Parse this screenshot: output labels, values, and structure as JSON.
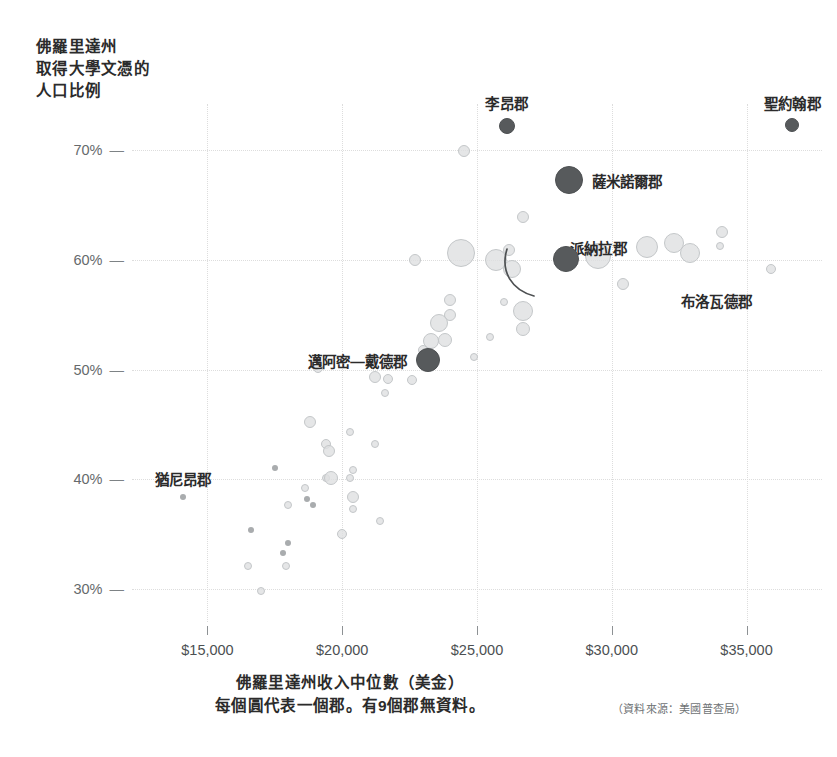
{
  "chart_data": {
    "type": "scatter",
    "title": "",
    "ylabel": "佛羅里達州取得大學文憑的人口比例",
    "xlabel": "佛羅里達州收入中位數（美金）",
    "xlim": [
      12200,
      37800
    ],
    "ylim": [
      27.0,
      73.5
    ],
    "grid": true,
    "legend": "none",
    "note": "每個圓代表一個郡。有9個郡無資料。",
    "source": "（資料來源：美國普查局）",
    "size_encoding": "圓面積代表郡人口",
    "y_ticks": [
      {
        "value": 70,
        "label": "70%"
      },
      {
        "value": 60,
        "label": "60%"
      },
      {
        "value": 50,
        "label": "50%"
      },
      {
        "value": 40,
        "label": "40%"
      },
      {
        "value": 30,
        "label": "30%"
      }
    ],
    "x_ticks": [
      {
        "value": 15000,
        "label": "$15,000"
      },
      {
        "value": 20000,
        "label": "$20,000"
      },
      {
        "value": 25000,
        "label": "$25,000"
      },
      {
        "value": 30000,
        "label": "$30,000"
      },
      {
        "value": 35000,
        "label": "$35,000"
      }
    ],
    "highlight_color": "#575a5c",
    "bubble_color": "#dee0e1",
    "labeled_points": [
      {
        "name": "李昂郡",
        "x": 26100,
        "y": 72.2,
        "r": 8,
        "style": "dark",
        "label_pos": "above-center"
      },
      {
        "name": "聖約翰郡",
        "x": 36700,
        "y": 72.3,
        "r": 7,
        "style": "dark",
        "label_pos": "above-center"
      },
      {
        "name": "薩米諾爾郡",
        "x": 28400,
        "y": 67.3,
        "r": 14,
        "style": "dark",
        "label_pos": "right"
      },
      {
        "name": "派納拉郡",
        "x": 31300,
        "y": 61.2,
        "r": 11,
        "style": "light",
        "label_pos": "left"
      },
      {
        "name": "布洛瓦德郡",
        "x": 28300,
        "y": 60.1,
        "r": 13,
        "style": "dark",
        "label_pos": "leader"
      },
      {
        "name": "邁阿密—戴德郡",
        "x": 23200,
        "y": 50.9,
        "r": 12,
        "style": "dark",
        "label_pos": "left"
      },
      {
        "name": "猶尼昂郡",
        "x": 14100,
        "y": 38.4,
        "r": 3,
        "style": "tiny",
        "label_pos": "above-center"
      }
    ],
    "points": [
      {
        "x": 24500,
        "y": 69.9,
        "r": 6
      },
      {
        "x": 26700,
        "y": 63.9,
        "r": 6
      },
      {
        "x": 22700,
        "y": 60.0,
        "r": 6
      },
      {
        "x": 24400,
        "y": 60.6,
        "r": 14
      },
      {
        "x": 25700,
        "y": 60.0,
        "r": 11
      },
      {
        "x": 26200,
        "y": 60.9,
        "r": 6
      },
      {
        "x": 26300,
        "y": 59.2,
        "r": 9
      },
      {
        "x": 29500,
        "y": 60.4,
        "r": 13
      },
      {
        "x": 32300,
        "y": 61.6,
        "r": 10
      },
      {
        "x": 32900,
        "y": 60.6,
        "r": 10
      },
      {
        "x": 34100,
        "y": 62.6,
        "r": 6
      },
      {
        "x": 34000,
        "y": 61.3,
        "r": 4
      },
      {
        "x": 30400,
        "y": 57.8,
        "r": 6
      },
      {
        "x": 35900,
        "y": 59.2,
        "r": 5
      },
      {
        "x": 24000,
        "y": 56.4,
        "r": 6
      },
      {
        "x": 24000,
        "y": 55.0,
        "r": 6
      },
      {
        "x": 23600,
        "y": 54.3,
        "r": 9
      },
      {
        "x": 26700,
        "y": 55.4,
        "r": 10
      },
      {
        "x": 26000,
        "y": 56.2,
        "r": 4
      },
      {
        "x": 26700,
        "y": 53.7,
        "r": 7
      },
      {
        "x": 23300,
        "y": 52.6,
        "r": 8
      },
      {
        "x": 23800,
        "y": 52.7,
        "r": 7
      },
      {
        "x": 23000,
        "y": 51.8,
        "r": 5
      },
      {
        "x": 25500,
        "y": 53.0,
        "r": 4
      },
      {
        "x": 24900,
        "y": 51.2,
        "r": 4
      },
      {
        "x": 19100,
        "y": 50.2,
        "r": 5
      },
      {
        "x": 21200,
        "y": 49.3,
        "r": 6
      },
      {
        "x": 21700,
        "y": 49.2,
        "r": 5
      },
      {
        "x": 22600,
        "y": 49.1,
        "r": 5
      },
      {
        "x": 21600,
        "y": 47.9,
        "r": 4
      },
      {
        "x": 18800,
        "y": 45.2,
        "r": 6
      },
      {
        "x": 20300,
        "y": 44.3,
        "r": 4
      },
      {
        "x": 19400,
        "y": 43.2,
        "r": 5
      },
      {
        "x": 19500,
        "y": 42.6,
        "r": 6
      },
      {
        "x": 21200,
        "y": 43.2,
        "r": 4
      },
      {
        "x": 17500,
        "y": 41.0,
        "r": 3
      },
      {
        "x": 20400,
        "y": 40.9,
        "r": 4
      },
      {
        "x": 19400,
        "y": 40.1,
        "r": 4
      },
      {
        "x": 19600,
        "y": 40.1,
        "r": 7
      },
      {
        "x": 20300,
        "y": 40.1,
        "r": 4
      },
      {
        "x": 18600,
        "y": 39.2,
        "r": 4
      },
      {
        "x": 20400,
        "y": 38.4,
        "r": 6
      },
      {
        "x": 18700,
        "y": 38.2,
        "r": 3
      },
      {
        "x": 18000,
        "y": 37.7,
        "r": 4
      },
      {
        "x": 18900,
        "y": 37.7,
        "r": 3
      },
      {
        "x": 20400,
        "y": 37.3,
        "r": 4
      },
      {
        "x": 21400,
        "y": 36.2,
        "r": 4
      },
      {
        "x": 16600,
        "y": 35.4,
        "r": 3
      },
      {
        "x": 20000,
        "y": 35.0,
        "r": 5
      },
      {
        "x": 18000,
        "y": 34.2,
        "r": 3
      },
      {
        "x": 17800,
        "y": 33.3,
        "r": 3
      },
      {
        "x": 16500,
        "y": 32.1,
        "r": 4
      },
      {
        "x": 17900,
        "y": 32.1,
        "r": 4
      },
      {
        "x": 17000,
        "y": 29.8,
        "r": 4
      }
    ]
  }
}
